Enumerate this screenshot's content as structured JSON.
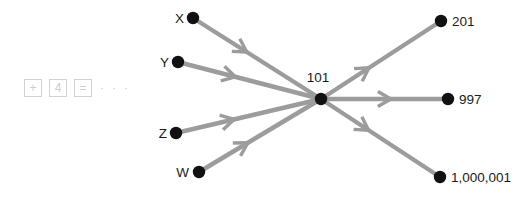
{
  "controls": {
    "items": [
      {
        "name": "plus-button",
        "label": "+"
      },
      {
        "name": "value-box",
        "label": "4"
      },
      {
        "name": "equals-button",
        "label": "="
      }
    ],
    "ellipsis": "· · ·"
  },
  "colors": {
    "edge": "#9c9c9c",
    "node": "#111111",
    "control_border": "#d2d2d2",
    "control_text": "#cdcdcd",
    "label_text": "#1a1a1a",
    "background": "#ffffff"
  },
  "graph": {
    "type": "directed-graph",
    "center": {
      "id": "c",
      "label": "101",
      "x": 321,
      "y": 99,
      "label_x": 318,
      "label_y": 82
    },
    "sources": [
      {
        "id": "x",
        "label": "X",
        "x": 193,
        "y": 18,
        "label_x": 184,
        "label_y": 23
      },
      {
        "id": "y",
        "label": "Y",
        "x": 178,
        "y": 62,
        "label_x": 169,
        "label_y": 67
      },
      {
        "id": "z",
        "label": "Z",
        "x": 176,
        "y": 133,
        "label_x": 167,
        "label_y": 138
      },
      {
        "id": "w",
        "label": "W",
        "x": 199,
        "y": 172,
        "label_x": 189,
        "label_y": 177
      }
    ],
    "targets": [
      {
        "id": "t201",
        "label": "201",
        "x": 441,
        "y": 21,
        "label_x": 452,
        "label_y": 26
      },
      {
        "id": "t997",
        "label": "997",
        "x": 448,
        "y": 99,
        "label_x": 459,
        "label_y": 104
      },
      {
        "id": "t1m",
        "label": "1,000,001",
        "x": 440,
        "y": 177,
        "label_x": 451,
        "label_y": 182
      }
    ],
    "edges": [
      {
        "from": "x",
        "to": "c",
        "arrow_t": 0.42
      },
      {
        "from": "y",
        "to": "c",
        "arrow_t": 0.4
      },
      {
        "from": "z",
        "to": "c",
        "arrow_t": 0.4
      },
      {
        "from": "w",
        "to": "c",
        "arrow_t": 0.4
      },
      {
        "from": "c",
        "to": "t201",
        "arrow_t": 0.4
      },
      {
        "from": "c",
        "to": "t997",
        "arrow_t": 0.55
      },
      {
        "from": "c",
        "to": "t1m",
        "arrow_t": 0.4
      }
    ],
    "node_radius": 6.2,
    "arrow_len": 15,
    "arrow_spread": 30
  }
}
